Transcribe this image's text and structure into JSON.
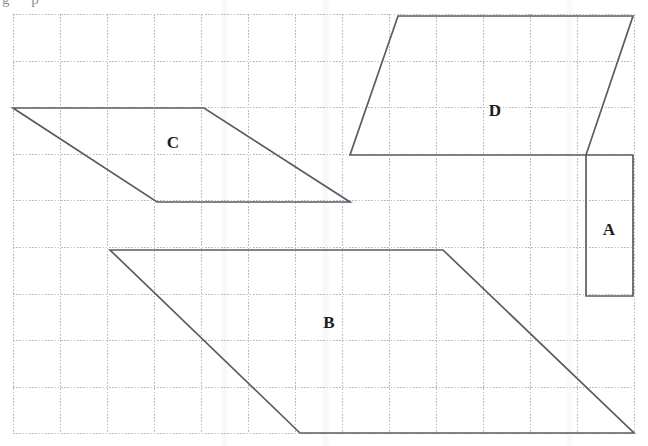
{
  "figure": {
    "title_fragment": "g   p",
    "background_color": "#ffffff",
    "grid": {
      "line_color": "#b9b9c4",
      "style": "dotted",
      "origin_x": 13,
      "origin_y": 14,
      "cell_width": 47,
      "cell_height": 46.6,
      "columns": 13,
      "rows": 9,
      "right_edge": 634,
      "bottom_edge": 433
    },
    "stroke_color": "#5b5b63",
    "shapes": [
      {
        "label": "A",
        "type": "rectangle",
        "label_x": 609,
        "label_y": 231,
        "points": "586,155 633,155 633,296 586,296",
        "grid_base_cells": 1,
        "grid_height_cells": 3
      },
      {
        "label": "B",
        "type": "parallelogram",
        "label_x": 329,
        "label_y": 324,
        "points": "110,250 443,250 634,433 300,433",
        "grid_base_cells": 7,
        "grid_height_cells": 4
      },
      {
        "label": "C",
        "type": "parallelogram",
        "label_x": 173,
        "label_y": 144,
        "points": "13,108 204,108 350,202 157,202",
        "grid_base_cells": 4,
        "grid_height_cells": 2
      },
      {
        "label": "D",
        "type": "parallelogram",
        "label_x": 495,
        "label_y": 112,
        "points": "398,16 633,16 586,155 350,155",
        "grid_base_cells": 5,
        "grid_height_cells": 3
      }
    ]
  },
  "chart_data": {
    "type": "table",
    "categories": [
      "A",
      "B",
      "C",
      "D"
    ],
    "values": [
      3,
      28,
      8,
      15
    ],
    "xlabel": "Shape",
    "ylabel": "Area (grid squares)"
  }
}
